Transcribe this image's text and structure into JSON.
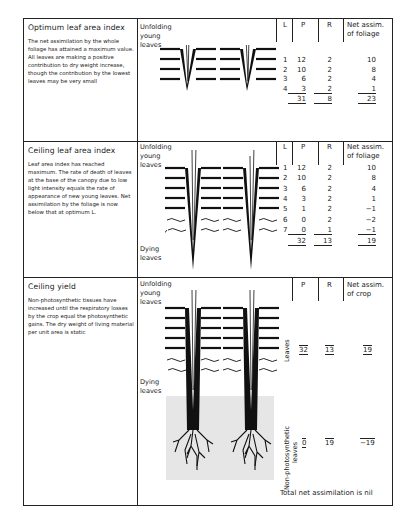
{
  "panels": [
    {
      "title": "Optimum leaf area index",
      "description": "The net assimilation by the whole foliage has attained a maximum value. All leaves are making a positive contribution to dry weight increase, though the contribution by the lowest leaves may be very small",
      "labels": {
        "top": "Unfolding young leaves"
      },
      "table": {
        "headers": [
          "L",
          "P",
          "R",
          "Net assim. of foliage"
        ],
        "rows": [
          {
            "L": "1",
            "P": "12",
            "R": "2",
            "N": "10"
          },
          {
            "L": "2",
            "P": "10",
            "R": "2",
            "N": "8"
          },
          {
            "L": "3",
            "P": "6",
            "R": "2",
            "N": "4"
          },
          {
            "L": "4",
            "P": "3",
            "R": "2",
            "N": "1"
          }
        ],
        "totals": {
          "P": "31",
          "R": "8",
          "N": "23"
        }
      }
    },
    {
      "title": "Ceiling leaf area index",
      "description": "Leaf area index has reached maximum. The rate of death of leaves at the base of the canopy due to low light intensity equals the rate of appearance of new young leaves. Net assimilation by the foliage is now below that at optimum L.",
      "labels": {
        "top": "Unfolding young leaves",
        "bottom": "Dying leaves"
      },
      "table": {
        "headers": [
          "L",
          "P",
          "R",
          "Net assim. of foliage"
        ],
        "rows": [
          {
            "L": "1",
            "P": "12",
            "R": "2",
            "N": "10"
          },
          {
            "L": "2",
            "P": "10",
            "R": "2",
            "N": "8"
          },
          {
            "L": "3",
            "P": "6",
            "R": "2",
            "N": "4"
          },
          {
            "L": "4",
            "P": "3",
            "R": "2",
            "N": "1"
          },
          {
            "L": "5",
            "P": "1",
            "R": "2",
            "N": "−1"
          },
          {
            "L": "6",
            "P": "0",
            "R": "2",
            "N": "−2"
          },
          {
            "L": "7",
            "P": "0",
            "R": "1",
            "N": "−1"
          }
        ],
        "totals": {
          "P": "32",
          "R": "13",
          "N": "19"
        }
      }
    },
    {
      "title": "Ceiling yield",
      "description": "Non-photosynthetic tissues have increased until the respiratory losses by the crop equal the photosynthetic gains. The dry weight of living material per unit area is static",
      "labels": {
        "top": "Unfolding young leaves",
        "bottom": "Dying leaves",
        "leaves": "Leaves",
        "nonphoto": "Non-photosynthetic leaves"
      },
      "table": {
        "headers": [
          "P",
          "R",
          "Net assim. of crop"
        ],
        "leaves_row": {
          "P": "32",
          "R": "13",
          "N": "19"
        },
        "nonphoto_row": {
          "P": "0",
          "R": "19",
          "N": "−19"
        }
      },
      "footer": "Total net assimilation is nil"
    }
  ]
}
